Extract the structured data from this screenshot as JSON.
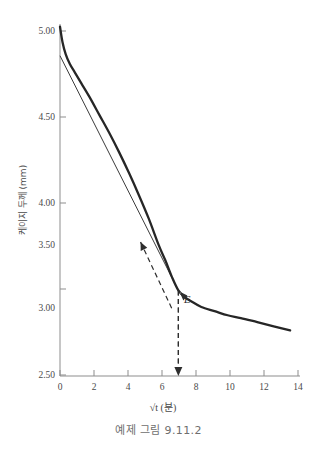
{
  "caption": "예제 그림 9.11.2",
  "chart_data": {
    "type": "line",
    "title": "",
    "xlabel": "√t (분)",
    "ylabel": "케이지 두께 (mm)",
    "xlim": [
      0,
      14.6
    ],
    "ylim": [
      2.5,
      5.05
    ],
    "xticks": [
      "0",
      "2",
      "4",
      "6",
      "8",
      "10",
      "12",
      "14"
    ],
    "xtick_values": [
      0,
      2,
      4,
      6,
      8,
      10,
      12,
      14
    ],
    "yticks": [
      "2.50",
      "3.00",
      "3.50",
      "4.00",
      "4.50",
      "5.00"
    ],
    "ytick_values": [
      2.5,
      3.0,
      3.5,
      4.0,
      4.5,
      5.0
    ],
    "grid": false,
    "legend": "none",
    "series": [
      {
        "name": "consolidation curve",
        "style": "solid-thick",
        "x": [
          0,
          0.15,
          0.35,
          0.6,
          0.9,
          1.3,
          1.8,
          2.4,
          3.0,
          3.6,
          4.2,
          4.8,
          5.4,
          6.0,
          6.4,
          6.8,
          7.2,
          7.6,
          8.0,
          8.6,
          9.4,
          10.2,
          11.0,
          12.0,
          13.0,
          14.0
        ],
        "y": [
          5.03,
          4.92,
          4.83,
          4.76,
          4.7,
          4.62,
          4.52,
          4.39,
          4.26,
          4.12,
          3.97,
          3.81,
          3.64,
          3.45,
          3.34,
          3.22,
          3.12,
          3.07,
          3.04,
          3.0,
          2.97,
          2.94,
          2.92,
          2.89,
          2.86,
          2.83
        ]
      },
      {
        "name": "secant line to E",
        "style": "solid-thin",
        "x": [
          0,
          7.2
        ],
        "y": [
          4.82,
          3.12
        ]
      },
      {
        "name": "tangent dashed line",
        "style": "dashed",
        "x": [
          4.9,
          6.8
        ],
        "y": [
          3.47,
          2.99
        ]
      }
    ],
    "annotations": [
      {
        "name": "point-E-label",
        "text": "E",
        "x": 7.55,
        "y": 3.03
      },
      {
        "name": "drop-line-to-axis",
        "text": "",
        "x": 7.2,
        "y_from": 3.12,
        "y_to": 2.5
      }
    ]
  }
}
